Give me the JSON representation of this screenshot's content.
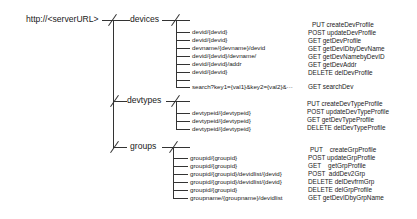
{
  "root": {
    "label": "http://<serverURL>"
  },
  "branches": [
    {
      "name": "devices",
      "routes": [
        {
          "path": "devid/{devid}",
          "method": "PUT",
          "operation": "createDevProfile"
        },
        {
          "path": "devid/{devid}",
          "method": "POST",
          "operation": "updateDevProfile"
        },
        {
          "path": "devname/{devname}/devid",
          "method": "GET",
          "operation": "getDevProfile"
        },
        {
          "path": "devid/{devid}/devname/",
          "method": "GET",
          "operation": "getDevIDbyDevName"
        },
        {
          "path": "devid/{devid}/addr",
          "method": "GET",
          "operation": "getDevNamebyDevID"
        },
        {
          "path": "devid/{devid}",
          "method": "GET",
          "operation": "getDevAddr"
        },
        {
          "path": "search?key1={val1}&key2={val2}&···",
          "method": "DELETE",
          "operation": "delDevProfile"
        },
        {
          "path": "",
          "method": "GET",
          "operation": "searchDev"
        }
      ]
    },
    {
      "name": "devtypes",
      "routes": [
        {
          "path": "",
          "method": "PUT",
          "operation": "createDevTypeProfile"
        },
        {
          "path": "devtypeid/{devtypeid}",
          "method": "POST",
          "operation": "updateDevTypeProfile"
        },
        {
          "path": "devtypeid/{devtypeid}",
          "method": "GET",
          "operation": "getDevTypeProfile"
        },
        {
          "path": "devtypeid/{devtypeid}",
          "method": "DELETE",
          "operation": "delDevTypeProfile"
        }
      ]
    },
    {
      "name": "groups",
      "routes": [
        {
          "path": "",
          "method": "PUT",
          "operation": "createGrpProfile"
        },
        {
          "path": "groupid/{groupid}",
          "method": "POST",
          "operation": "updateGrpProfile"
        },
        {
          "path": "groupid/{groupid}",
          "method": "GET",
          "operation": "getGrpProfile"
        },
        {
          "path": "groupid/{groupid}/devidlist/{devid}",
          "method": "POST",
          "operation": "addDev2Grp"
        },
        {
          "path": "groupid/{groupid}/devidlist/{devid}",
          "method": "DELETE",
          "operation": "delDevfrmGrp"
        },
        {
          "path": "groupid/{groupid}",
          "method": "DELETE",
          "operation": "delGrpProfile"
        },
        {
          "path": "groupname/{groupname}/devidlist",
          "method": "GET",
          "operation": "getDevIDbyGrpName"
        }
      ]
    }
  ],
  "leaf_paths": {
    "devices": [
      "devid/{devid}",
      "devid/{devid}",
      "devname/{devname}/devid",
      "devid/{devid}/devname/",
      "devid/{devid}/addr",
      "devid/{devid}",
      "search?key1={val1}&key2={val2}&···"
    ],
    "devtypes": [
      "devtypeid/{devtypeid}",
      "devtypeid/{devtypeid}",
      "devtypeid/{devtypeid}"
    ],
    "groups": [
      "groupid/{groupid}",
      "groupid/{groupid}",
      "groupid/{groupid}/devidlist/{devid}",
      "groupid/{groupid}/devidlist/{devid}",
      "groupid/{groupid}",
      "groupname/{groupname}/devidlist"
    ]
  },
  "operations": {
    "devices": [
      "PUT createDevProfile",
      "POST updateDevProfile",
      "GET getDevProfile",
      "GET getDevIDbyDevName",
      "GET getDevNamebyDevID",
      "GET getDevAddr",
      "DELETE delDevProfile",
      "GET searchDev"
    ],
    "devtypes": [
      "PUT createDevTypeProfile",
      "POST updateDevTypeProfile",
      "GET getDevTypeProfile",
      "DELETE delDevTypeProfile"
    ],
    "groups": [
      "PUT    createGrpProfile",
      "POST updateGrpProfile",
      "GET    getGrpProfile",
      "POST  addDev2Grp",
      "DELETE delDevfrmGrp",
      "DELETE delGrpProfile",
      "GET getDevIDbyGrpName"
    ]
  }
}
